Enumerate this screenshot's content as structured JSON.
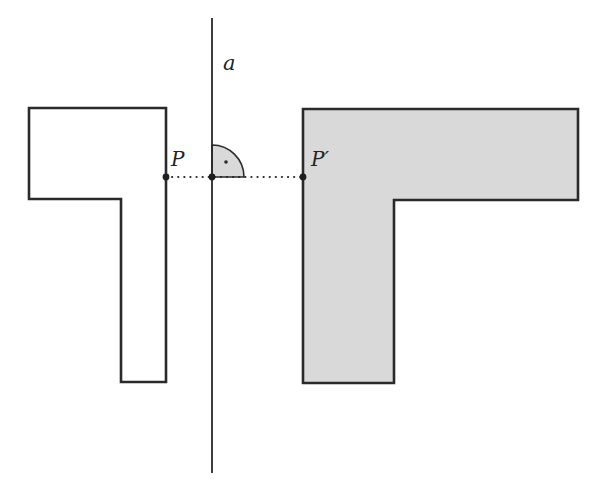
{
  "figure": {
    "type": "axial reflection",
    "background_color": "#ffffff",
    "stroke_color": "#2a2a2a",
    "image_fill_color": "#d9d9d9",
    "angle_mark_fill_color": "#d9d9d9"
  },
  "axis": {
    "label": "a",
    "x": 212,
    "y_top": 18,
    "y_bottom": 473,
    "label_pos": [
      223,
      70
    ]
  },
  "original_shape": {
    "name": "original L-shape",
    "fill": "none",
    "points": [
      [
        29,
        108
      ],
      [
        166,
        108
      ],
      [
        166,
        382
      ],
      [
        121,
        382
      ],
      [
        121,
        199
      ],
      [
        29,
        199
      ]
    ]
  },
  "image_shape": {
    "name": "reflected L-shape",
    "fill": "#d9d9d9",
    "points": [
      [
        303,
        109
      ],
      [
        578,
        109
      ],
      [
        578,
        200
      ],
      [
        394,
        200
      ],
      [
        394,
        383
      ],
      [
        303,
        383
      ]
    ]
  },
  "points": [
    {
      "name": "P",
      "label": "P",
      "x": 166,
      "y": 177,
      "label_pos": [
        171,
        166
      ]
    },
    {
      "name": "foot",
      "label": "",
      "x": 212,
      "y": 177
    },
    {
      "name": "P-prime",
      "label": "P′",
      "x": 303,
      "y": 177,
      "label_pos": [
        311,
        166
      ]
    }
  ],
  "perpendicular_segment": {
    "style": "dotted",
    "from": [
      166,
      177
    ],
    "to": [
      303,
      177
    ]
  },
  "right_angle_mark": {
    "center": [
      212,
      177
    ],
    "radius": 32,
    "dot": [
      226,
      162
    ]
  }
}
